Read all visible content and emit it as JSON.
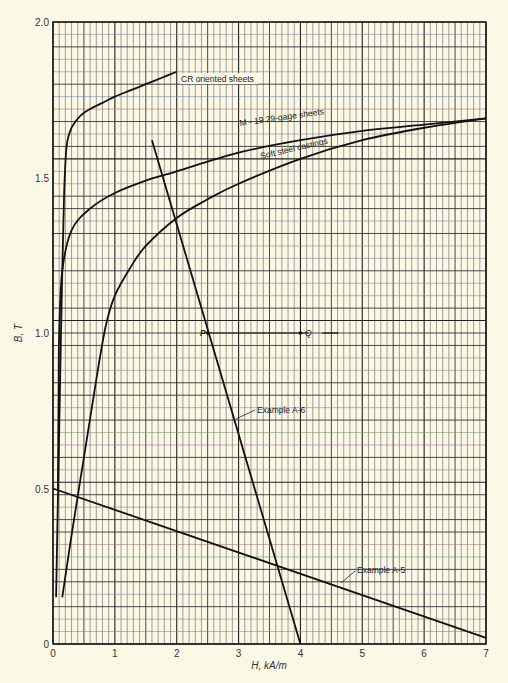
{
  "chart_data": {
    "type": "line",
    "title": "",
    "xlabel": "H, kA/m",
    "ylabel": "B, T",
    "xlim": [
      0,
      7
    ],
    "ylim": [
      0,
      2.0
    ],
    "x_ticks": [
      "0",
      "1",
      "2",
      "3",
      "4",
      "5",
      "6",
      "7"
    ],
    "y_ticks": [
      "0",
      "0.5",
      "1.0",
      "1.5",
      "2.0"
    ],
    "grid": {
      "on": true,
      "minor_x_step": 0.1,
      "minor_y_step": 0.04,
      "major_x_step": 1,
      "major_y_step": 0.5,
      "medium_x_step": 0.5,
      "medium_y_step": 0.1
    },
    "legend": "inline labels",
    "series": [
      {
        "name": "CR oriented sheets",
        "x": [
          0.05,
          0.12,
          0.15,
          0.18,
          0.22,
          0.3,
          0.45,
          0.6,
          0.8,
          1.0,
          1.25,
          1.5,
          1.75,
          2.0
        ],
        "y": [
          0.15,
          0.9,
          1.2,
          1.45,
          1.6,
          1.66,
          1.7,
          1.72,
          1.74,
          1.76,
          1.78,
          1.8,
          1.82,
          1.84
        ]
      },
      {
        "name": "M - 19 29-gage sheets",
        "x": [
          0.08,
          0.09,
          0.1,
          0.15,
          0.3,
          0.6,
          1.0,
          1.5,
          2.0,
          3.0,
          4.0,
          5.0,
          6.0,
          7.0
        ],
        "y": [
          0.5,
          0.8,
          1.0,
          1.2,
          1.33,
          1.4,
          1.45,
          1.49,
          1.52,
          1.58,
          1.62,
          1.65,
          1.67,
          1.69
        ]
      },
      {
        "name": "Soft steel castings",
        "x": [
          0.15,
          0.3,
          0.5,
          0.7,
          0.85,
          1.0,
          1.25,
          1.5,
          2.0,
          2.5,
          3.0,
          4.0,
          5.0,
          6.0,
          7.0
        ],
        "y": [
          0.15,
          0.35,
          0.6,
          0.85,
          1.02,
          1.12,
          1.21,
          1.28,
          1.37,
          1.43,
          1.48,
          1.56,
          1.62,
          1.66,
          1.69
        ]
      },
      {
        "name": "Example A-6",
        "x": [
          1.6,
          4.0
        ],
        "y": [
          1.62,
          0.0
        ]
      },
      {
        "name": "Example A-5",
        "x": [
          0.0,
          7.0
        ],
        "y": [
          0.5,
          0.02
        ]
      }
    ],
    "annotations": [
      {
        "text": "P",
        "x": 2.5,
        "y": 1.0
      },
      {
        "text": "Q",
        "x": 4.0,
        "y": 1.0
      },
      {
        "text": "CR oriented sheets",
        "x": 2.05,
        "y": 1.77
      },
      {
        "text": "M - 19 29-gage sheets",
        "x": 2.65,
        "y": 1.6
      },
      {
        "text": "Soft steel castings",
        "x": 2.75,
        "y": 1.48
      },
      {
        "text": "Example A-6",
        "x": 3.4,
        "y": 0.79
      },
      {
        "text": "Example A-5",
        "x": 5.15,
        "y": 0.24
      }
    ]
  },
  "labels": {
    "cr": "CR oriented sheets",
    "m19": "M - 19 29-gage sheets",
    "soft": "Soft steel castings",
    "a6": "Example A-6",
    "a5": "Example A-5",
    "p": "P",
    "q": "Q",
    "xlabel": "H, kA/m",
    "ylabel": "B, T"
  },
  "colors": {
    "paper": "#fbf8e6",
    "grid_minor": "#4a4a4a",
    "curve": "#111111"
  }
}
